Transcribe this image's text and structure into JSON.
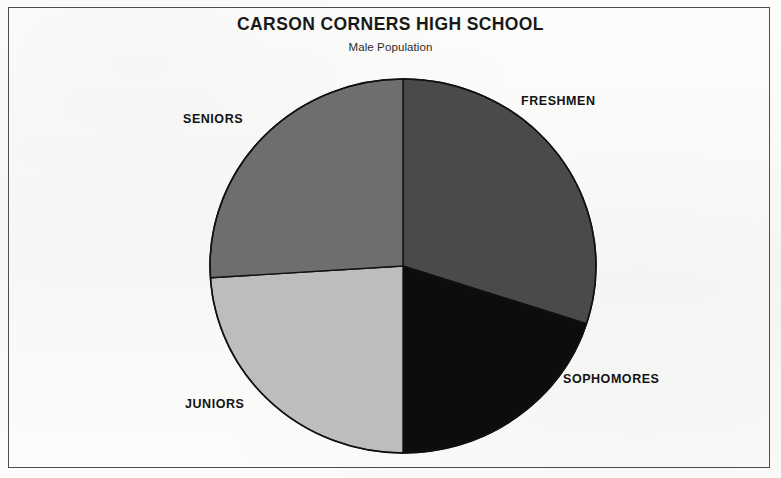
{
  "chart": {
    "title": "CARSON CORNERS HIGH SCHOOL",
    "subtitle": "Male Population"
  },
  "labels": {
    "freshmen": "FRESHMEN",
    "sophomores": "SOPHOMORES",
    "juniors": "JUNIORS",
    "seniors": "SENIORS"
  },
  "chart_data": {
    "type": "pie",
    "title": "CARSON CORNERS HIGH SCHOOL",
    "subtitle": "Male Population",
    "xlabel": "",
    "ylabel": "",
    "legend": "none",
    "grid": false,
    "labels_placement": "outside-around-pie",
    "start_angle_deg": 90,
    "direction": "clockwise",
    "categories": [
      "FRESHMEN",
      "SOPHOMORES",
      "JUNIORS",
      "SENIORS"
    ],
    "values": [
      30,
      20,
      24,
      26
    ],
    "units": "percent",
    "angles_deg": [
      108,
      72,
      87,
      93
    ],
    "colors": [
      "#4a4a4a",
      "#0d0d0d",
      "#bdbdbd",
      "#6e6e6e"
    ],
    "slices": [
      {
        "label": "FRESHMEN",
        "value": 30,
        "angle_deg": 108,
        "color": "#4a4a4a",
        "start_deg": 90,
        "end_deg": -18
      },
      {
        "label": "SOPHOMORES",
        "value": 20,
        "angle_deg": 72,
        "color": "#0d0d0d",
        "start_deg": -18,
        "end_deg": -90
      },
      {
        "label": "JUNIORS",
        "value": 24,
        "angle_deg": 87,
        "color": "#bdbdbd",
        "start_deg": -90,
        "end_deg": -177
      },
      {
        "label": "SENIORS",
        "value": 26,
        "angle_deg": 93,
        "color": "#6e6e6e",
        "start_deg": -177,
        "end_deg": -270
      }
    ]
  },
  "style": {
    "frame_color": "#4d4d4d",
    "background": "#fbfbfa",
    "outline_color": "#111111",
    "title_color": "#191919",
    "label_color": "#131313"
  }
}
